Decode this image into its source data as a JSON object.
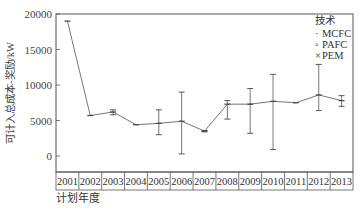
{
  "chart_data": {
    "type": "line",
    "title": "",
    "xlabel": "计划年度",
    "ylabel": "可计入总成本-奖励/kW",
    "ylim": [
      -2500,
      20000
    ],
    "yticks": [
      0,
      5000,
      10000,
      15000,
      20000
    ],
    "grid": false,
    "legend": {
      "title": "技术",
      "position": "top-right",
      "entries": [
        "MCFC",
        "PAFC",
        "PEM"
      ]
    },
    "categories": [
      "2001",
      "2002",
      "2003",
      "2004",
      "2005",
      "2006",
      "2007",
      "2008",
      "2009",
      "2010",
      "2011",
      "2012",
      "2013"
    ],
    "series": [
      {
        "name": "mean",
        "values": [
          19000,
          5700,
          6200,
          4400,
          4600,
          4900,
          3500,
          7300,
          7300,
          7700,
          7500,
          8600,
          7800
        ]
      },
      {
        "name": "range_min",
        "values": [
          19000,
          5700,
          5800,
          4400,
          3000,
          300,
          3400,
          5200,
          3200,
          900,
          7500,
          6400,
          7000
        ]
      },
      {
        "name": "range_max",
        "values": [
          19000,
          5700,
          6500,
          4400,
          6500,
          9000,
          3600,
          7800,
          9500,
          11500,
          7500,
          12900,
          8500
        ]
      }
    ]
  }
}
